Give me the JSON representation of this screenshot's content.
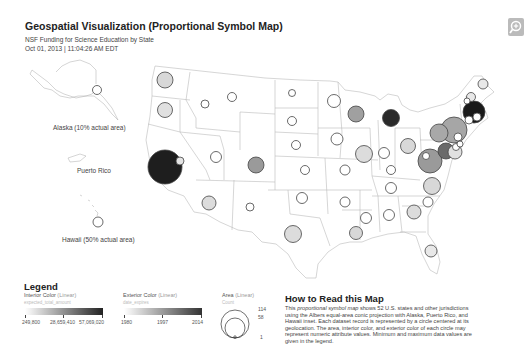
{
  "header": {
    "title": "Geospatial Visualization (Proportional Symbol Map)",
    "subtitle": "NSF Funding for Science Education by State",
    "timestamp": "Oct 01, 2013 | 11:04:26 AM EDT"
  },
  "toolbar": {
    "zoom_icon": "magnifier-plus-icon"
  },
  "map": {
    "insets": {
      "alaska": "Alaska (10% actual area)",
      "puerto_rico": "Puerto Rico",
      "hawaii": "Hawaii (50% actual area)"
    },
    "symbols": [
      {
        "state": "WA",
        "x": 165,
        "y": 80,
        "r": 8,
        "fill": "#d8d8d8"
      },
      {
        "state": "OR",
        "x": 165,
        "y": 110,
        "r": 7.5,
        "fill": "#e0e0e0"
      },
      {
        "state": "CA",
        "x": 165,
        "y": 167,
        "r": 17,
        "fill": "#1e1e1e"
      },
      {
        "state": "NV",
        "x": 180,
        "y": 161,
        "r": 4,
        "fill": "#e4e4e4"
      },
      {
        "state": "ID",
        "x": 205,
        "y": 104,
        "r": 4,
        "fill": "#ffffff"
      },
      {
        "state": "MT",
        "x": 232,
        "y": 97,
        "r": 4.5,
        "fill": "#ffffff"
      },
      {
        "state": "UT",
        "x": 216,
        "y": 157,
        "r": 5.5,
        "fill": "#ffffff"
      },
      {
        "state": "AZ",
        "x": 209,
        "y": 203,
        "r": 7,
        "fill": "#dcdcdc"
      },
      {
        "state": "CO",
        "x": 256,
        "y": 165,
        "r": 8,
        "fill": "#9a9a9a"
      },
      {
        "state": "NM",
        "x": 250,
        "y": 207,
        "r": 4,
        "fill": "#ffffff"
      },
      {
        "state": "WY",
        "x": 0,
        "y": 0,
        "r": 0,
        "fill": "#ffffff"
      },
      {
        "state": "ND",
        "x": 292,
        "y": 93,
        "r": 3.5,
        "fill": "#ffffff"
      },
      {
        "state": "SD",
        "x": 292,
        "y": 121,
        "r": 4.5,
        "fill": "#ffffff"
      },
      {
        "state": "NE",
        "x": 296,
        "y": 145,
        "r": 4.5,
        "fill": "#ffffff"
      },
      {
        "state": "KS",
        "x": 305,
        "y": 170,
        "r": 4.5,
        "fill": "#ffffff"
      },
      {
        "state": "OK",
        "x": 302,
        "y": 198,
        "r": 5.5,
        "fill": "#ffffff"
      },
      {
        "state": "TX",
        "x": 293,
        "y": 234,
        "r": 8.5,
        "fill": "#dcdcdc"
      },
      {
        "state": "MN",
        "x": 334,
        "y": 101,
        "r": 6.5,
        "fill": "#ffffff"
      },
      {
        "state": "IA",
        "x": 337,
        "y": 139,
        "r": 6,
        "fill": "#ffffff"
      },
      {
        "state": "MO",
        "x": 345,
        "y": 170,
        "r": 5,
        "fill": "#ffffff"
      },
      {
        "state": "AR",
        "x": 345,
        "y": 202,
        "r": 5,
        "fill": "#ffffff"
      },
      {
        "state": "LA",
        "x": 356,
        "y": 233,
        "r": 6.5,
        "fill": "#d8d8d8"
      },
      {
        "state": "WI",
        "x": 356,
        "y": 114,
        "r": 8,
        "fill": "#a0a0a0"
      },
      {
        "state": "IL",
        "x": 364,
        "y": 154,
        "r": 8.5,
        "fill": "#dcdcdc"
      },
      {
        "state": "MI",
        "x": 391,
        "y": 118,
        "r": 8.5,
        "fill": "#2a2a2a"
      },
      {
        "state": "IN",
        "x": 384,
        "y": 153,
        "r": 5.5,
        "fill": "#ffffff"
      },
      {
        "state": "OH",
        "x": 408,
        "y": 146,
        "r": 7.5,
        "fill": "#d8d8d8"
      },
      {
        "state": "KY",
        "x": 391,
        "y": 170,
        "r": 4.5,
        "fill": "#ffffff"
      },
      {
        "state": "TN",
        "x": 391,
        "y": 188,
        "r": 5.5,
        "fill": "#ffffff"
      },
      {
        "state": "MS",
        "x": 366,
        "y": 218,
        "r": 5.5,
        "fill": "#ffffff"
      },
      {
        "state": "AL",
        "x": 389,
        "y": 215,
        "r": 5.5,
        "fill": "#ffffff"
      },
      {
        "state": "GA",
        "x": 414,
        "y": 212,
        "r": 7,
        "fill": "#dcdcdc"
      },
      {
        "state": "FL",
        "x": 431,
        "y": 251,
        "r": 6,
        "fill": "#e8e8e8"
      },
      {
        "state": "SC",
        "x": 428,
        "y": 202,
        "r": 5,
        "fill": "#ffffff"
      },
      {
        "state": "NC",
        "x": 432,
        "y": 186,
        "r": 8.5,
        "fill": "#d8d8d8"
      },
      {
        "state": "VA",
        "x": 430,
        "y": 161,
        "r": 12,
        "fill": "#9a9a9a"
      },
      {
        "state": "WV",
        "x": 426,
        "y": 156,
        "r": 3.5,
        "fill": "#ffffff"
      },
      {
        "state": "PA",
        "x": 439,
        "y": 133,
        "r": 9,
        "fill": "#a8a8a8"
      },
      {
        "state": "MD",
        "x": 446,
        "y": 151,
        "r": 8,
        "fill": "#6a6a6a"
      },
      {
        "state": "DC",
        "x": 455,
        "y": 152,
        "r": 7,
        "fill": "#e0e0e0"
      },
      {
        "state": "DE",
        "x": 456,
        "y": 147,
        "r": 3.5,
        "fill": "#ffffff"
      },
      {
        "state": "NJ",
        "x": 460,
        "y": 144,
        "r": 3,
        "fill": "#ffffff"
      },
      {
        "state": "NY",
        "x": 454,
        "y": 130,
        "r": 13,
        "fill": "#a6a6a6"
      },
      {
        "state": "NY2",
        "x": 458,
        "y": 137,
        "r": 4,
        "fill": "#ffffff"
      },
      {
        "state": "CT",
        "x": 469,
        "y": 120,
        "r": 4,
        "fill": "#ffffff"
      },
      {
        "state": "MA",
        "x": 474,
        "y": 112,
        "r": 11,
        "fill": "#1a1a1a"
      },
      {
        "state": "RI",
        "x": 477,
        "y": 117,
        "r": 4,
        "fill": "#ffffff"
      },
      {
        "state": "VT",
        "x": 467,
        "y": 101,
        "r": 3,
        "fill": "#ffffff"
      },
      {
        "state": "NH",
        "x": 471,
        "y": 97,
        "r": 4.5,
        "fill": "#e8e8e8"
      },
      {
        "state": "ME",
        "x": 483,
        "y": 84,
        "r": 5,
        "fill": "#e8e8e8"
      },
      {
        "state": "AK",
        "x": 97,
        "y": 90,
        "r": 4.5,
        "fill": "#ffffff"
      },
      {
        "state": "HI",
        "x": 98,
        "y": 222,
        "r": 5,
        "fill": "#ffffff"
      }
    ]
  },
  "legend": {
    "title": "Legend",
    "interior": {
      "label": "Interior Color",
      "scale": "(Linear)",
      "field": "expected_total_amount",
      "ticks": [
        "249,800",
        "28,659,410",
        "57,069,020"
      ],
      "colors": [
        "#ffffff",
        "#222222"
      ]
    },
    "exterior": {
      "label": "Exterior Color",
      "scale": "(Linear)",
      "field": "date_expires",
      "ticks": [
        "1980",
        "1997",
        "2014"
      ],
      "colors": [
        "#ffffff",
        "#333333"
      ]
    },
    "area": {
      "label": "Area",
      "scale": "(Linear)",
      "field": "Count",
      "ticks": [
        "114",
        "58",
        "1"
      ]
    }
  },
  "howto": {
    "title": "How to Read this Map",
    "body_pre": "This ",
    "body_em": "proportional symbol map",
    "body_post": " shows 52 U.S. states and other jurisdictions using the Albers equal-area conic projection with Alaska, Puerto Rico, and Hawaii inset. Each dataset record is represented by a circle centered at its geolocation. The area, interior color, and exterior color of each circle may represent numeric attribute values. Minimum and maximum data values are given in the legend."
  }
}
